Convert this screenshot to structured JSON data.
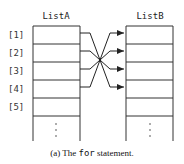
{
  "diagram": {
    "listA": {
      "title": "ListA"
    },
    "listB": {
      "title": "ListB"
    },
    "indices": [
      "[1]",
      "[2]",
      "[3]",
      "[4]",
      "[5]"
    ],
    "ellipsis": "⋮",
    "mapping": [
      {
        "from": 1,
        "to": 4
      },
      {
        "from": 2,
        "to": 3
      },
      {
        "from": 3,
        "to": 2
      },
      {
        "from": 4,
        "to": 1
      }
    ]
  },
  "caption": {
    "label": "(a) The ",
    "code": "for",
    "rest": " statement."
  }
}
